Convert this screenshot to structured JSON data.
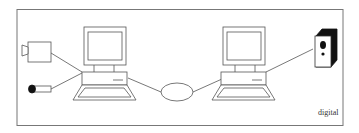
{
  "diagram": {
    "caption": "digital",
    "colors": {
      "stroke": "#555555",
      "frame": "#777777",
      "fill": "#ffffff",
      "dark": "#111111"
    },
    "nodes": [
      {
        "id": "camera",
        "label": "video-camera-icon"
      },
      {
        "id": "microphone",
        "label": "microphone-icon"
      },
      {
        "id": "computer-left",
        "label": "computer-icon"
      },
      {
        "id": "network",
        "label": "network-cloud-ellipse"
      },
      {
        "id": "computer-right",
        "label": "computer-icon"
      },
      {
        "id": "speaker",
        "label": "speaker-icon"
      }
    ],
    "edges": [
      {
        "from": "camera",
        "to": "computer-left"
      },
      {
        "from": "microphone",
        "to": "computer-left"
      },
      {
        "from": "computer-left",
        "to": "network"
      },
      {
        "from": "network",
        "to": "computer-right"
      },
      {
        "from": "computer-right",
        "to": "speaker"
      }
    ]
  }
}
